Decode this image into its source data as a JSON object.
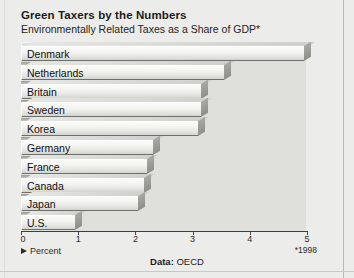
{
  "header": {
    "title": "Green Taxers by the Numbers",
    "subtitle": "Environmentally Related Taxes as a Share of GDP*"
  },
  "footer": {
    "legend_label": "Percent",
    "legend_marker_icon": "triangle-right-icon",
    "note": "*1998",
    "source_prefix": "Data:",
    "source_value": "OECD"
  },
  "chart_data": {
    "type": "bar",
    "orientation": "horizontal",
    "title": "Green Taxers by the Numbers",
    "subtitle": "Environmentally Related Taxes as a Share of GDP*",
    "xlabel": "Percent",
    "ylabel": "",
    "xlim": [
      0,
      5
    ],
    "xticks": [
      0,
      1,
      2,
      3,
      4,
      5
    ],
    "xtick_labels": [
      "0",
      "1",
      "2",
      "3",
      "4",
      "5"
    ],
    "grid": false,
    "legend": false,
    "categories": [
      "Denmark",
      "Netherlands",
      "Britain",
      "Sweden",
      "Korea",
      "Germany",
      "France",
      "Canada",
      "Japan",
      "U.S."
    ],
    "values": [
      4.95,
      3.55,
      3.15,
      3.15,
      3.1,
      2.3,
      2.2,
      2.15,
      2.05,
      0.95
    ],
    "annotations": [
      "*1998"
    ],
    "source": "Data: OECD"
  }
}
